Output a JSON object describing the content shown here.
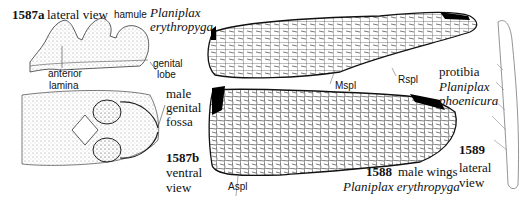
{
  "figure_1587": {
    "number_a": "1587a",
    "view_a": "lateral view",
    "label_hamule": "hamule",
    "species_line1": "Planiplax",
    "species_line2": "erythropyga",
    "label_genital_lobe_1": "genital",
    "label_genital_lobe_2": "lobe",
    "label_anterior_lamina_1": "anterior",
    "label_anterior_lamina_2": "lamina",
    "label_fossa_1": "male",
    "label_fossa_2": "genital",
    "label_fossa_3": "fossa",
    "number_b": "1587b",
    "view_b_1": "ventral",
    "view_b_2": "view"
  },
  "figure_1588": {
    "label_mspl": "Mspl",
    "label_rspl": "Rspl",
    "label_aspl": "Aspl",
    "number": "1588",
    "caption": "male wings",
    "species": "Planiplax erythropyga"
  },
  "figure_1589": {
    "label_1": "protibia",
    "species_1": "Planiplax",
    "species_2": "phoenicura",
    "number": "1589",
    "view_1": "lateral",
    "view_2": "view"
  }
}
